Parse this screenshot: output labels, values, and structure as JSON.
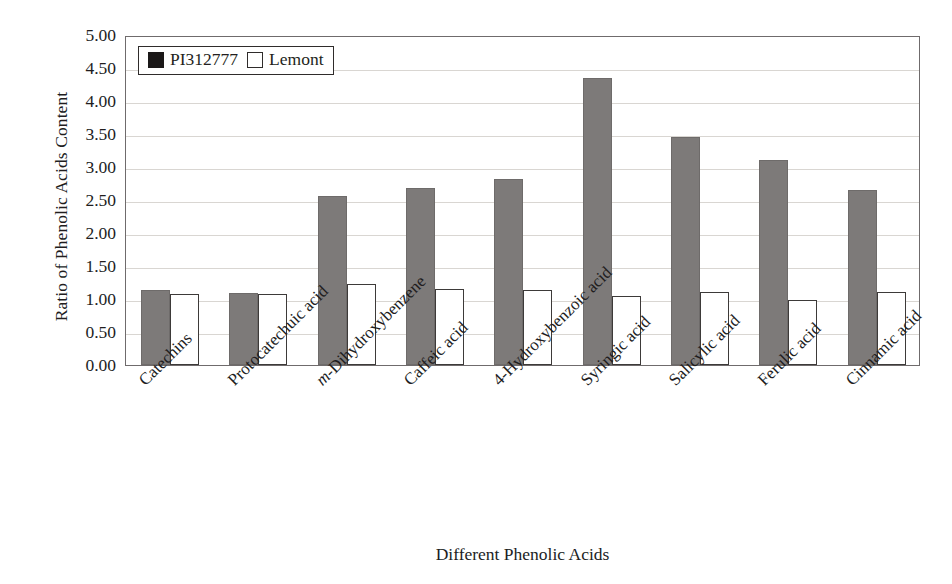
{
  "chart_data": {
    "type": "bar",
    "title": "",
    "xlabel": "Different Phenolic Acids",
    "ylabel": "Ratio of Phenolic Acids Content",
    "ylim": [
      0.0,
      5.0
    ],
    "ytick_step": 0.5,
    "ytick_labels": [
      "5.00",
      "4.50",
      "4.00",
      "3.50",
      "3.00",
      "2.50",
      "2.00",
      "1.50",
      "1.00",
      "0.50",
      "0.00"
    ],
    "ytick_values": [
      5.0,
      4.5,
      4.0,
      3.5,
      3.0,
      2.5,
      2.0,
      1.5,
      1.0,
      0.5,
      0.0
    ],
    "grid": true,
    "grid_axis": "y",
    "legend_position": "top-left",
    "categories": [
      "Catechins",
      "Protocatechuic acid",
      "m-Dihydroxybenzene",
      "Caffeic acid",
      "4-Hydroxybenzoic acid",
      "Syringic acid",
      "Salicylic acid",
      "Ferulic acid",
      "Cinnamic acid"
    ],
    "categories_html": [
      "Catechins",
      "Protocatechuic acid",
      "<i>m</i>-Dihydroxybenzene",
      "Caffeic acid",
      "4-Hydroxybenzoic acid",
      "Syringic acid",
      "Salicylic acid",
      "Ferulic acid",
      "Cinnamic acid"
    ],
    "series": [
      {
        "name": "PI312777",
        "color": "#7d7a79",
        "style": "filled",
        "values": [
          1.13,
          1.09,
          2.56,
          2.68,
          2.82,
          4.35,
          3.46,
          3.1,
          2.65
        ]
      },
      {
        "name": "Lemont",
        "color": "#ffffff",
        "style": "open",
        "values": [
          1.08,
          1.08,
          1.22,
          1.15,
          1.13,
          1.04,
          1.11,
          0.99,
          1.1
        ]
      }
    ]
  },
  "legend": {
    "entries": [
      {
        "label": "PI312777",
        "swatch": "filled-square-icon"
      },
      {
        "label": "Lemont",
        "swatch": "open-square-icon"
      }
    ]
  },
  "axes": {
    "y_title": "Ratio of Phenolic Acids Content",
    "x_title": "Different Phenolic Acids"
  },
  "colors": {
    "series_a_fill": "#7d7a79",
    "series_b_fill": "#ffffff",
    "series_b_stroke": "#3d3a39",
    "gridline": "#d9d6d2",
    "frame": "#6f6b6c",
    "text": "#211d1e",
    "background": "#ffffff"
  }
}
